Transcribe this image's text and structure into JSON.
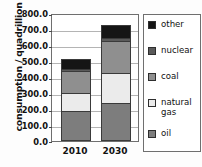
{
  "chart_data": {
    "type": "bar",
    "subtype": "stacked",
    "title": "",
    "xlabel": "",
    "ylabel": "consumption / quadrillion BTU",
    "categories": [
      "2010",
      "2030"
    ],
    "ylim": [
      0,
      800
    ],
    "ytick_labels": [
      "0.0",
      "100.0",
      "200.0",
      "300.0",
      "400.0",
      "500.0",
      "600.0",
      "700.0",
      "800.0"
    ],
    "ytick_values": [
      0,
      100,
      200,
      300,
      400,
      500,
      600,
      700,
      800
    ],
    "grid": true,
    "legend_position": "right",
    "stack_order_bottom_to_top": [
      "oil",
      "natural gas",
      "coal",
      "nuclear",
      "other"
    ],
    "series": [
      {
        "name": "oil",
        "values": [
          185,
          235
        ],
        "color": "#7d7d7d"
      },
      {
        "name": "natural gas",
        "values": [
          115,
          190
        ],
        "color": "#ebebeb"
      },
      {
        "name": "coal",
        "values": [
          135,
          200
        ],
        "color": "#8f8f8f"
      },
      {
        "name": "nuclear",
        "values": [
          15,
          20
        ],
        "color": "#5a5a5a"
      },
      {
        "name": "other",
        "values": [
          60,
          80
        ],
        "color": "#151515"
      }
    ],
    "totals": [
      510,
      725
    ]
  },
  "legend": {
    "items": [
      {
        "label": "other",
        "color": "#151515"
      },
      {
        "label": "nuclear",
        "color": "#5a5a5a"
      },
      {
        "label": "coal",
        "color": "#8f8f8f"
      },
      {
        "label": "natural gas",
        "color": "#ebebeb"
      },
      {
        "label": "oil",
        "color": "#7d7d7d"
      }
    ]
  }
}
